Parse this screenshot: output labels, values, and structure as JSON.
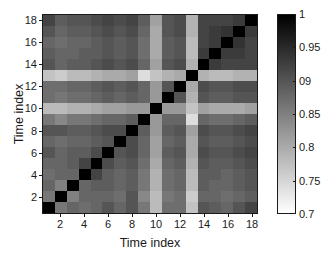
{
  "figure": {
    "background": "#ffffff",
    "axis_color": "#1a1a1a"
  },
  "axes": {
    "xlabel": "Time index",
    "ylabel": "Time index",
    "xticks": [
      "2",
      "4",
      "6",
      "8",
      "10",
      "12",
      "14",
      "16",
      "18"
    ],
    "yticks": [
      "2",
      "4",
      "6",
      "8",
      "10",
      "12",
      "14",
      "16",
      "18"
    ]
  },
  "colorbar": {
    "ticks": [
      "1",
      "0.95",
      "09",
      "0.85",
      "0.8",
      "0.75",
      "0.7"
    ],
    "top_color": "#000000",
    "bottom_color": "#ffffff",
    "vmin": 0.7,
    "vmax": 1
  },
  "chart_data": {
    "type": "heatmap",
    "title": "",
    "xlabel": "Time index",
    "ylabel": "Time index",
    "xtick_labels": [
      "2",
      "4",
      "6",
      "8",
      "10",
      "12",
      "14",
      "16",
      "18"
    ],
    "ytick_labels": [
      "2",
      "4",
      "6",
      "8",
      "10",
      "12",
      "14",
      "16",
      "18"
    ],
    "xlim": [
      0.5,
      18.5
    ],
    "ylim": [
      0.5,
      18.5
    ],
    "x": [
      1,
      2,
      3,
      4,
      5,
      6,
      7,
      8,
      9,
      10,
      11,
      12,
      13,
      14,
      15,
      16,
      17,
      18
    ],
    "y": [
      1,
      2,
      3,
      4,
      5,
      6,
      7,
      8,
      9,
      10,
      11,
      12,
      13,
      14,
      15,
      16,
      17,
      18
    ],
    "y_axis_direction": "up",
    "grid": false,
    "legend": "none",
    "colormap": "gray_reversed",
    "cmin": 0.7,
    "cmax": 1.0,
    "symmetric": true,
    "values": [
      [
        1.0,
        0.86,
        0.88,
        0.87,
        0.88,
        0.9,
        0.88,
        0.9,
        0.86,
        0.78,
        0.87,
        0.87,
        0.77,
        0.9,
        0.89,
        0.88,
        0.9,
        0.92
      ],
      [
        0.86,
        1.0,
        0.85,
        0.88,
        0.88,
        0.88,
        0.87,
        0.9,
        0.84,
        0.78,
        0.86,
        0.87,
        0.76,
        0.88,
        0.88,
        0.87,
        0.88,
        0.89
      ],
      [
        0.88,
        0.85,
        1.0,
        0.88,
        0.89,
        0.89,
        0.88,
        0.89,
        0.86,
        0.79,
        0.87,
        0.88,
        0.78,
        0.89,
        0.88,
        0.88,
        0.89,
        0.9
      ],
      [
        0.87,
        0.88,
        0.88,
        1.0,
        0.92,
        0.89,
        0.88,
        0.89,
        0.86,
        0.79,
        0.87,
        0.88,
        0.78,
        0.89,
        0.89,
        0.88,
        0.89,
        0.9
      ],
      [
        0.88,
        0.88,
        0.89,
        0.92,
        1.0,
        0.91,
        0.89,
        0.9,
        0.87,
        0.8,
        0.88,
        0.89,
        0.79,
        0.9,
        0.89,
        0.89,
        0.9,
        0.91
      ],
      [
        0.9,
        0.88,
        0.89,
        0.89,
        0.91,
        1.0,
        0.9,
        0.91,
        0.88,
        0.81,
        0.89,
        0.9,
        0.8,
        0.91,
        0.9,
        0.9,
        0.91,
        0.92
      ],
      [
        0.88,
        0.87,
        0.88,
        0.88,
        0.89,
        0.9,
        1.0,
        0.91,
        0.88,
        0.81,
        0.88,
        0.89,
        0.8,
        0.9,
        0.89,
        0.89,
        0.9,
        0.91
      ],
      [
        0.9,
        0.9,
        0.89,
        0.89,
        0.9,
        0.91,
        0.91,
        1.0,
        0.89,
        0.82,
        0.89,
        0.9,
        0.81,
        0.91,
        0.9,
        0.9,
        0.91,
        0.92
      ],
      [
        0.86,
        0.84,
        0.86,
        0.86,
        0.87,
        0.88,
        0.88,
        0.89,
        1.0,
        0.82,
        0.88,
        0.88,
        0.74,
        0.88,
        0.87,
        0.87,
        0.88,
        0.89
      ],
      [
        0.78,
        0.78,
        0.79,
        0.79,
        0.8,
        0.81,
        0.81,
        0.82,
        0.82,
        1.0,
        0.82,
        0.82,
        0.77,
        0.81,
        0.8,
        0.8,
        0.8,
        0.81
      ],
      [
        0.87,
        0.86,
        0.87,
        0.87,
        0.88,
        0.89,
        0.88,
        0.89,
        0.88,
        0.82,
        1.0,
        0.9,
        0.79,
        0.9,
        0.89,
        0.89,
        0.9,
        0.9
      ],
      [
        0.87,
        0.87,
        0.88,
        0.88,
        0.89,
        0.9,
        0.89,
        0.9,
        0.88,
        0.82,
        0.9,
        1.0,
        0.8,
        0.91,
        0.9,
        0.9,
        0.91,
        0.91
      ],
      [
        0.77,
        0.76,
        0.78,
        0.78,
        0.79,
        0.8,
        0.8,
        0.81,
        0.74,
        0.77,
        0.79,
        0.8,
        1.0,
        0.79,
        0.78,
        0.78,
        0.79,
        0.79
      ],
      [
        0.9,
        0.88,
        0.89,
        0.89,
        0.9,
        0.91,
        0.9,
        0.91,
        0.88,
        0.81,
        0.9,
        0.91,
        0.79,
        1.0,
        0.93,
        0.92,
        0.92,
        0.92
      ],
      [
        0.89,
        0.88,
        0.88,
        0.89,
        0.89,
        0.9,
        0.89,
        0.9,
        0.87,
        0.8,
        0.89,
        0.9,
        0.78,
        0.93,
        1.0,
        0.93,
        0.93,
        0.92
      ],
      [
        0.88,
        0.87,
        0.88,
        0.88,
        0.89,
        0.9,
        0.89,
        0.9,
        0.87,
        0.8,
        0.89,
        0.9,
        0.78,
        0.92,
        0.93,
        1.0,
        0.94,
        0.92
      ],
      [
        0.9,
        0.88,
        0.89,
        0.89,
        0.9,
        0.91,
        0.9,
        0.91,
        0.88,
        0.8,
        0.9,
        0.91,
        0.79,
        0.92,
        0.93,
        0.94,
        1.0,
        0.93
      ],
      [
        0.92,
        0.89,
        0.9,
        0.9,
        0.91,
        0.92,
        0.91,
        0.92,
        0.89,
        0.81,
        0.9,
        0.91,
        0.79,
        0.92,
        0.92,
        0.92,
        0.93,
        1.0
      ]
    ]
  }
}
